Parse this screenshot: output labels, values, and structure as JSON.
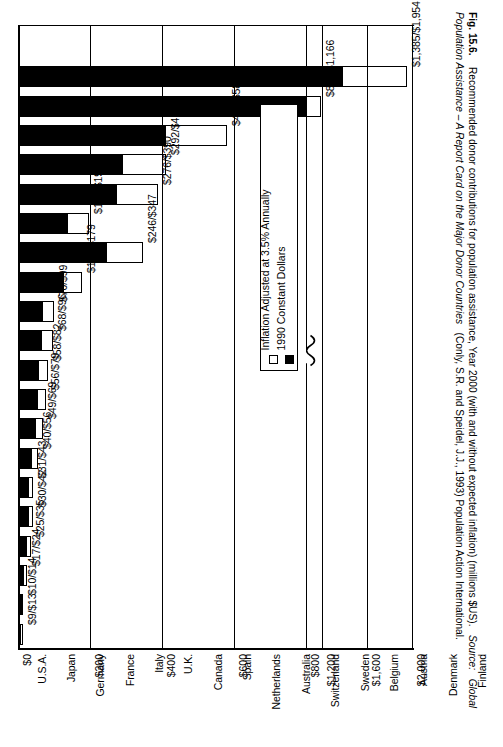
{
  "figure": {
    "number_label": "Fig. 15.6.",
    "caption_main": "Recommended donor contributions for population assistance, Year 2000 (with and without expected inflation) (millions $US).",
    "source_prefix": "Source:",
    "source_title": "Global Population Assistance – A Report Card on the Major Donor Countries",
    "source_rest": "(Conly, S.R. and Speidel, J.J., 1993) Population Action International."
  },
  "legend": {
    "items": [
      {
        "label": "Inflation Adjusted at 3.5% Annually",
        "swatch": "hollow",
        "color": "#ffffff"
      },
      {
        "label": "1990 Constant Dollars",
        "swatch": "solid",
        "color": "#000000"
      }
    ]
  },
  "axis": {
    "value_ticks": [
      "$0",
      "$200",
      "$400",
      "$600",
      "$800",
      "$1,200",
      "$1,600",
      "$2,000"
    ],
    "has_break": true,
    "break_between": [
      "$800",
      "$1,200"
    ]
  },
  "chart_data": {
    "type": "bar",
    "orientation": "vertical-rotated",
    "title": "Recommended donor contributions for population assistance, Year 2000 (with and without expected inflation) (millions $US)",
    "xlabel": "",
    "ylabel": "millions $US",
    "ylim": [
      0,
      2000
    ],
    "grid": true,
    "legend_position": "inside-center-right",
    "axis_break": {
      "from": 800,
      "to": 1200
    },
    "tick_values": [
      0,
      200,
      400,
      600,
      800,
      1200,
      1600,
      2000
    ],
    "tick_labels": [
      "$0",
      "$200",
      "$400",
      "$600",
      "$800",
      "$1,200",
      "$1,600",
      "$2,000"
    ],
    "categories": [
      "U.S.A.",
      "Japan",
      "Germany",
      "France",
      "Italy",
      "U.K.",
      "Canada",
      "Spain",
      "Netherlands",
      "Australia",
      "Switzerland",
      "Sweden",
      "Belgium",
      "Austria",
      "Denmark",
      "Finland",
      "Norway",
      "Portugal",
      "New Zealand",
      "Ireland"
    ],
    "series": [
      {
        "name": "1990 Constant Dollars",
        "color": "#000000",
        "values": [
          1385,
          826,
          412,
          292,
          276,
          139,
          246,
          127,
          70,
          68,
          58,
          56,
          49,
          40,
          31,
          30,
          25,
          17,
          10,
          9
        ]
      },
      {
        "name": "Inflation Adjusted at 3.5% Annually",
        "color": "#ffffff",
        "values": [
          1954,
          1166,
          581,
          412,
          390,
          197,
          347,
          179,
          99,
          96,
          82,
          79,
          69,
          56,
          43,
          42,
          35,
          24,
          14,
          13
        ]
      }
    ],
    "data_labels": [
      "$1,385/$1,954",
      "$826/$1,166",
      "$412/$581",
      "$292/$412",
      "$276/$390",
      "$139/$197",
      "$246/$347",
      "$127/$179",
      "$70/$99",
      "$68/$96",
      "$58/$82",
      "$56/$79",
      "$49/$69",
      "$40/$56",
      "$31/$43",
      "$30/$42",
      "$25/$35",
      "$17/$24",
      "$10/$14",
      "$9/$13"
    ]
  }
}
